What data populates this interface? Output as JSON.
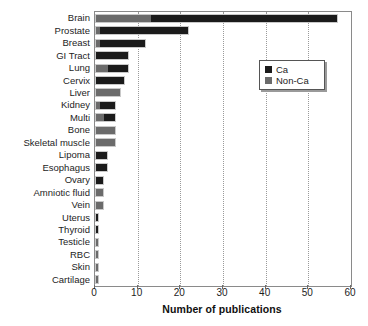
{
  "chart_data": {
    "type": "bar",
    "orientation": "horizontal",
    "stacked": true,
    "title": "",
    "xlabel": "Number of publications",
    "ylabel": "",
    "xlim": [
      0,
      60
    ],
    "ylim": null,
    "xticks": [
      0,
      10,
      20,
      30,
      40,
      50,
      60
    ],
    "xtick_labels": [
      "0",
      "10",
      "20",
      "30",
      "40",
      "50",
      "60"
    ],
    "grid": "vertical-dotted",
    "legend_position": "upper right",
    "categories": [
      "Brain",
      "Prostate",
      "Breast",
      "GI Tract",
      "Lung",
      "Cervix",
      "Liver",
      "Kidney",
      "Multi",
      "Bone",
      "Skeletal muscle",
      "Lipoma",
      "Esophagus",
      "Ovary",
      "Amniotic fluid",
      "Vein",
      "Uterus",
      "Thyroid",
      "Testicle",
      "RBC",
      "Skin",
      "Cartilage"
    ],
    "series": [
      {
        "name": "Non-Ca",
        "color": "#6b6b6b",
        "values": [
          13,
          1,
          1,
          0,
          3,
          0,
          6,
          1,
          2,
          5,
          5,
          0,
          0,
          0,
          2,
          2,
          0,
          0,
          1,
          1,
          1,
          1
        ]
      },
      {
        "name": "Ca",
        "color": "#1b1b1b",
        "values": [
          44,
          21,
          11,
          8,
          5,
          7,
          0,
          4,
          3,
          0,
          0,
          3,
          3,
          2,
          0,
          0,
          1,
          1,
          0,
          0,
          0,
          0
        ]
      }
    ],
    "totals": [
      57,
      22,
      12,
      8,
      8,
      7,
      6,
      5,
      5,
      5,
      5,
      3,
      3,
      2,
      2,
      2,
      1,
      1,
      1,
      1,
      1,
      1
    ]
  },
  "legend": {
    "entries": [
      {
        "label": "Ca",
        "swatch": "#1b1b1b"
      },
      {
        "label": "Non-Ca",
        "swatch": "#6b6b6b"
      }
    ]
  },
  "axis": {
    "x_title": "Number of publications"
  }
}
